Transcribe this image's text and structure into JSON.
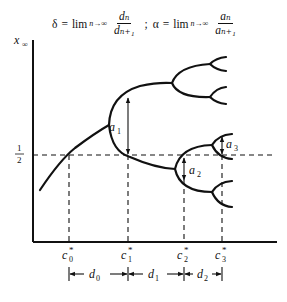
{
  "formula": {
    "delta_sym": "δ",
    "eq": "=",
    "lim": "lim",
    "lim_sub": "n→∞",
    "delta_num": "dₙ",
    "delta_den": "dₙ₊₁",
    "sep": ";",
    "alpha_sym": "α",
    "alpha_num": "aₙ",
    "alpha_den": "aₙ₊₁"
  },
  "axes": {
    "y_label": "x",
    "y_label_sub": "∞",
    "half_num": "1",
    "half_den": "2"
  },
  "c_labels": [
    {
      "base": "c",
      "sup": "*",
      "sub": "0"
    },
    {
      "base": "c",
      "sup": "*",
      "sub": "1"
    },
    {
      "base": "c",
      "sup": "*",
      "sub": "2"
    },
    {
      "base": "c",
      "sup": "*",
      "sub": "3"
    }
  ],
  "d_labels": [
    {
      "base": "d",
      "sub": "0"
    },
    {
      "base": "d",
      "sub": "1"
    },
    {
      "base": "d",
      "sub": "2"
    }
  ],
  "a_labels": [
    {
      "base": "a",
      "sub": "1"
    },
    {
      "base": "a",
      "sub": "2"
    },
    {
      "base": "a",
      "sub": "3"
    }
  ],
  "colors": {
    "ink": "#111111",
    "background": "#ffffff"
  }
}
